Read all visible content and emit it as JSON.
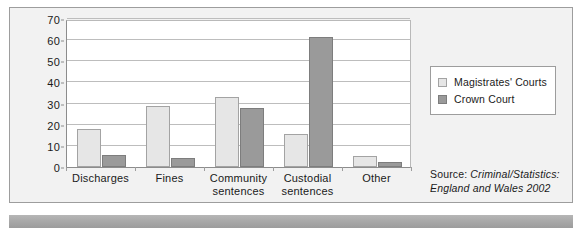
{
  "chart_data": {
    "type": "bar",
    "title": "",
    "subtitle": "",
    "xlabel": "",
    "ylabel": "",
    "ylim": [
      0,
      70
    ],
    "y_ticks": [
      0,
      10,
      20,
      30,
      40,
      50,
      60,
      70
    ],
    "y_tick_labels": [
      "0",
      "10",
      "20",
      "30",
      "40",
      "50",
      "60",
      "70"
    ],
    "grid": true,
    "grid_axis": "y",
    "legend_position": "right",
    "categories": [
      "Discharges",
      "Fines",
      "Community sentences",
      "Custodial sentences",
      "Other"
    ],
    "category_lines": [
      [
        "Discharges"
      ],
      [
        "Fines"
      ],
      [
        "Community",
        "sentences"
      ],
      [
        "Custodial",
        "sentences"
      ],
      [
        "Other"
      ]
    ],
    "series": [
      {
        "name": "Magistrates' Courts",
        "color": "#e6e6e6",
        "border": "#a3a3a3",
        "values": [
          18,
          29,
          33,
          15.5,
          5
        ]
      },
      {
        "name": "Crown Court",
        "color": "#9a9a9a",
        "border": "#7d7d7d",
        "values": [
          5.5,
          4.5,
          28,
          61.5,
          2.5
        ]
      }
    ],
    "annotations": [
      "Source: Criminal/Statistics:",
      "England and Wales 2002"
    ]
  },
  "legend": {
    "entries": [
      {
        "label": "Magistrates' Courts",
        "swatch": "light"
      },
      {
        "label": "Crown Court",
        "swatch": "dark"
      }
    ]
  },
  "source": {
    "prefix": "Source: ",
    "title_line1": "Criminal/Statistics:",
    "title_line2": "England and Wales 2002"
  },
  "colors": {
    "series_light": "#e6e6e6",
    "series_dark": "#9a9a9a",
    "panel_background": "#f2f2f2",
    "plot_background": "#ffffff",
    "gridline": "#bdbdbd",
    "frame": "#9d9d9d",
    "footer_band": "#a9a9a9",
    "text": "#1a1a1a"
  }
}
